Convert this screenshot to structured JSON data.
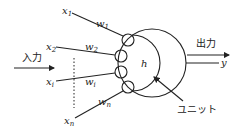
{
  "diagram": {
    "input_label": "入力",
    "output_label": "出力",
    "unit_label": "ユニット",
    "threshold_label": "h",
    "output_var": "y",
    "inputs": [
      {
        "x": "x",
        "x_sub": "1",
        "w": "w",
        "w_sub": "1"
      },
      {
        "x": "x",
        "x_sub": "2",
        "w": "w",
        "w_sub": "2"
      },
      {
        "x": "x",
        "x_sub": "i",
        "w": "w",
        "w_sub": "i"
      },
      {
        "x": "x",
        "x_sub": "n",
        "w": "w",
        "w_sub": "n"
      }
    ],
    "colors": {
      "stroke": "#222222",
      "background": "#ffffff"
    }
  }
}
